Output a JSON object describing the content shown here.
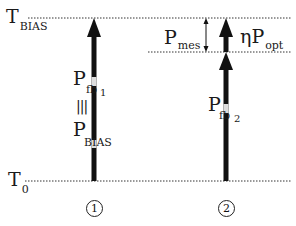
{
  "levels": {
    "top": {
      "main": "T",
      "sub": "BIAS"
    },
    "bottom": {
      "main": "T",
      "sub": "0"
    }
  },
  "column1": {
    "label_top": {
      "main": "P",
      "sub": "fb",
      "subsub": "1"
    },
    "equiv_symbol": "|||",
    "label_bottom": {
      "main": "P",
      "sub": "BIAS"
    },
    "marker": "1"
  },
  "column2": {
    "label_fb": {
      "main": "P",
      "sub": "fb",
      "subsub": "2"
    },
    "label_mes": {
      "main": "P",
      "sub": "mes"
    },
    "label_opt": {
      "prefix": "η",
      "main": "P",
      "sub": "opt"
    },
    "marker": "2"
  },
  "colors": {
    "line": "#111111",
    "dotted": "#333333",
    "background": "#ffffff"
  }
}
